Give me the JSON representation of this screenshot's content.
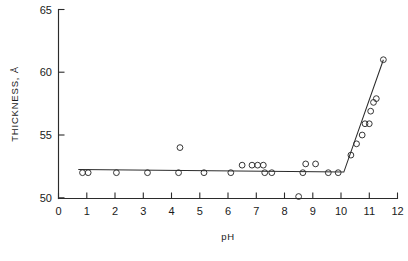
{
  "chart_data": {
    "type": "scatter",
    "title": "",
    "xlabel": "pH",
    "ylabel": "THICKNESS, Å",
    "xlim": [
      0,
      12
    ],
    "ylim": [
      50,
      65
    ],
    "grid": false,
    "legend": null,
    "x_ticks": [
      0,
      1,
      2,
      3,
      4,
      5,
      6,
      7,
      8,
      9,
      10,
      11,
      12
    ],
    "x_tick_labels": [
      "0",
      "1",
      "2",
      "3",
      "4",
      "5",
      "6",
      "7",
      "8",
      "9",
      "10",
      "11",
      "12"
    ],
    "y_ticks": [
      50,
      55,
      60,
      65
    ],
    "y_tick_labels": [
      "50",
      "55",
      "60",
      "65"
    ],
    "x_minor_tick_interval": 1,
    "marker_style": "open-circle",
    "series": [
      {
        "name": "measured thickness",
        "points": [
          [
            0.85,
            52.0
          ],
          [
            1.05,
            52.0
          ],
          [
            2.05,
            52.0
          ],
          [
            3.15,
            52.0
          ],
          [
            4.25,
            52.0
          ],
          [
            4.3,
            54.0
          ],
          [
            5.15,
            52.0
          ],
          [
            6.1,
            52.0
          ],
          [
            6.5,
            52.6
          ],
          [
            6.85,
            52.6
          ],
          [
            7.05,
            52.6
          ],
          [
            7.25,
            52.6
          ],
          [
            7.3,
            52.0
          ],
          [
            7.55,
            52.0
          ],
          [
            8.5,
            50.1
          ],
          [
            8.65,
            52.0
          ],
          [
            8.75,
            52.7
          ],
          [
            9.1,
            52.7
          ],
          [
            9.55,
            52.0
          ],
          [
            9.9,
            52.0
          ],
          [
            10.35,
            53.4
          ],
          [
            10.55,
            54.3
          ],
          [
            10.75,
            55.0
          ],
          [
            10.85,
            55.9
          ],
          [
            11.0,
            55.9
          ],
          [
            11.05,
            56.9
          ],
          [
            11.15,
            57.6
          ],
          [
            11.25,
            57.9
          ],
          [
            11.5,
            61.0
          ]
        ]
      }
    ],
    "fit_line": {
      "name": "fitted trend",
      "vertices": [
        [
          0.7,
          52.25
        ],
        [
          10.1,
          52.05
        ],
        [
          11.5,
          61.0
        ]
      ]
    }
  }
}
